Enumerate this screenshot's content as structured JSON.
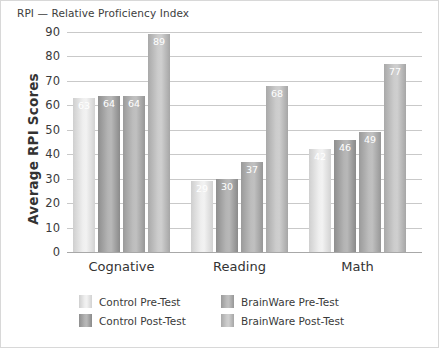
{
  "chart_data": {
    "type": "bar",
    "title": "RPI — Relative Proficiency Index",
    "xlabel": "",
    "ylabel": "Average RPI Scores",
    "categories": [
      "Cognative",
      "Reading",
      "Math"
    ],
    "series": [
      {
        "name": "Control Pre-Test",
        "values": [
          63,
          29,
          42
        ],
        "color": "#eeeeee"
      },
      {
        "name": "Control Post-Test",
        "values": [
          64,
          30,
          46
        ],
        "color": "#9a9a9a"
      },
      {
        "name": "BrainWare Pre-Test",
        "values": [
          64,
          37,
          49
        ],
        "color": "#a5a5a5"
      },
      {
        "name": "BrainWare Post-Test",
        "values": [
          89,
          68,
          77
        ],
        "color": "#c2c2c2"
      }
    ],
    "ylim": [
      0,
      90
    ],
    "yticks": [
      0,
      10,
      20,
      30,
      40,
      50,
      60,
      70,
      80,
      90
    ],
    "ytick_labels": [
      "0",
      "10",
      "20",
      "30",
      "40",
      "50",
      "60",
      "70",
      "80",
      "90"
    ],
    "grid": "horizontal",
    "legend_position": "bottom",
    "value_labels": true
  },
  "legend": {
    "items": [
      {
        "label": "Control Pre-Test"
      },
      {
        "label": "BrainWare Pre-Test"
      },
      {
        "label": "Control Post-Test"
      },
      {
        "label": "BrainWare Post-Test"
      }
    ]
  }
}
